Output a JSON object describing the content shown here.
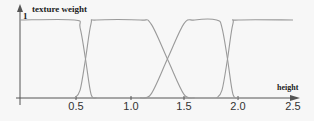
{
  "chart_data": {
    "type": "line",
    "title": "",
    "xlabel": "height",
    "ylabel": "texture weight",
    "xlim": [
      0,
      2.5
    ],
    "ylim": [
      0,
      1
    ],
    "x_ticks": [
      "0.5",
      "1.0",
      "1.5",
      "2.0",
      "2.5"
    ],
    "y_ticks": [
      "1"
    ],
    "grid": false,
    "legend": null,
    "line_color": "#9a9a9a",
    "axis_color": "#555555",
    "series": [
      {
        "name": "texture 1",
        "x": [
          0,
          0.5,
          0.55,
          0.6,
          0.65,
          0.7
        ],
        "values": [
          1,
          1,
          0.9,
          0.5,
          0.05,
          0
        ]
      },
      {
        "name": "texture 2",
        "x": [
          0.5,
          0.55,
          0.6,
          0.65,
          0.7,
          1.1,
          1.2,
          1.35,
          1.5,
          1.6
        ],
        "values": [
          0,
          0.1,
          0.5,
          0.95,
          1,
          1,
          0.95,
          0.5,
          0.05,
          0
        ]
      },
      {
        "name": "texture 3",
        "x": [
          1.1,
          1.2,
          1.35,
          1.5,
          1.6,
          1.8,
          1.85,
          1.9,
          1.95,
          2.0
        ],
        "values": [
          0,
          0.05,
          0.5,
          0.95,
          1,
          1,
          0.9,
          0.5,
          0.05,
          0
        ]
      },
      {
        "name": "texture 4",
        "x": [
          1.8,
          1.85,
          1.9,
          1.95,
          2.0,
          2.5
        ],
        "values": [
          0,
          0.1,
          0.5,
          0.95,
          1,
          1
        ]
      }
    ]
  },
  "labels": {
    "ylabel": "texture weight",
    "xlabel": "height",
    "y_one": "1",
    "ticks": [
      "0.5",
      "1.0",
      "1.5",
      "2.0",
      "2.5"
    ]
  }
}
